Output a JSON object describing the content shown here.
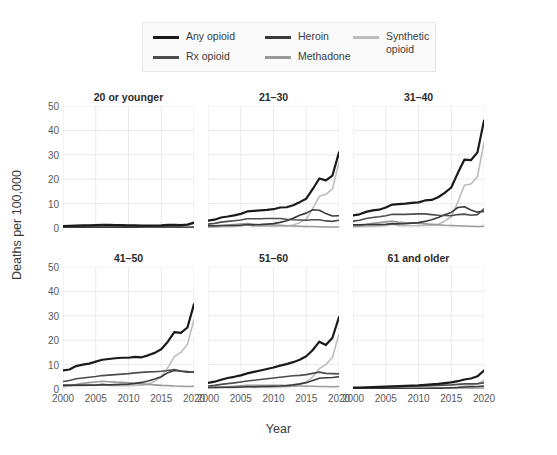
{
  "chart_data": {
    "type": "line",
    "title": "",
    "xlabel": "Year",
    "ylabel": "Deaths per 100,000",
    "xlim": [
      2000,
      2020
    ],
    "ylim": [
      0,
      50
    ],
    "xticks": [
      2000,
      2005,
      2010,
      2015,
      2020
    ],
    "yticks": [
      0,
      10,
      20,
      30,
      40,
      50
    ],
    "grid": true,
    "legend_position": "top-center",
    "facet_layout": [
      2,
      3
    ],
    "legend": [
      {
        "name": "Any opioid",
        "color": "#1a1a1a"
      },
      {
        "name": "Rx opioid",
        "color": "#4d4d4d"
      },
      {
        "name": "Heroin",
        "color": "#3a3a3a"
      },
      {
        "name": "Methadone",
        "color": "#9a9a9a"
      },
      {
        "name": "Synthetic\nopioid",
        "color": "#bdbdbd"
      }
    ],
    "x": [
      2000,
      2001,
      2002,
      2003,
      2004,
      2005,
      2006,
      2007,
      2008,
      2009,
      2010,
      2011,
      2012,
      2013,
      2014,
      2015,
      2016,
      2017,
      2018,
      2019,
      2020
    ],
    "panels": [
      {
        "title": "20 or younger",
        "series": [
          {
            "name": "Any opioid",
            "color": "#1a1a1a",
            "width": 2.2,
            "values": [
              0.8,
              0.9,
              1.0,
              1.1,
              1.1,
              1.2,
              1.3,
              1.3,
              1.2,
              1.2,
              1.1,
              1.1,
              1.0,
              1.0,
              1.0,
              1.1,
              1.3,
              1.3,
              1.2,
              1.4,
              2.2
            ]
          },
          {
            "name": "Rx opioid",
            "color": "#4d4d4d",
            "width": 1.6,
            "values": [
              0.4,
              0.5,
              0.6,
              0.7,
              0.7,
              0.8,
              0.8,
              0.8,
              0.8,
              0.7,
              0.7,
              0.6,
              0.6,
              0.5,
              0.5,
              0.4,
              0.4,
              0.4,
              0.3,
              0.3,
              0.4
            ]
          },
          {
            "name": "Heroin",
            "color": "#3a3a3a",
            "width": 1.6,
            "values": [
              0.2,
              0.2,
              0.2,
              0.2,
              0.2,
              0.3,
              0.3,
              0.3,
              0.3,
              0.3,
              0.3,
              0.3,
              0.4,
              0.5,
              0.5,
              0.5,
              0.5,
              0.4,
              0.3,
              0.2,
              0.2
            ]
          },
          {
            "name": "Methadone",
            "color": "#9a9a9a",
            "width": 1.6,
            "values": [
              0.1,
              0.1,
              0.2,
              0.2,
              0.3,
              0.3,
              0.3,
              0.3,
              0.2,
              0.2,
              0.2,
              0.1,
              0.1,
              0.1,
              0.1,
              0.1,
              0.1,
              0.1,
              0.1,
              0.1,
              0.1
            ]
          },
          {
            "name": "Synthetic opioid",
            "color": "#bdbdbd",
            "width": 1.6,
            "values": [
              0.1,
              0.1,
              0.1,
              0.1,
              0.2,
              0.2,
              0.2,
              0.2,
              0.1,
              0.1,
              0.1,
              0.1,
              0.1,
              0.2,
              0.3,
              0.4,
              0.6,
              0.7,
              0.8,
              1.0,
              1.8
            ]
          }
        ]
      },
      {
        "title": "21–30",
        "series": [
          {
            "name": "Any opioid",
            "color": "#1a1a1a",
            "width": 2.2,
            "values": [
              3.0,
              3.4,
              4.3,
              4.7,
              5.2,
              5.8,
              6.8,
              7.0,
              7.2,
              7.4,
              7.7,
              8.4,
              8.5,
              9.3,
              10.6,
              12.0,
              16.0,
              20.3,
              19.5,
              21.5,
              31.0
            ]
          },
          {
            "name": "Rx opioid",
            "color": "#4d4d4d",
            "width": 1.6,
            "values": [
              1.6,
              1.9,
              2.4,
              2.7,
              3.0,
              3.3,
              3.8,
              3.8,
              3.8,
              3.9,
              3.9,
              3.9,
              3.6,
              3.4,
              3.3,
              3.2,
              3.4,
              3.4,
              2.9,
              2.7,
              3.2
            ]
          },
          {
            "name": "Heroin",
            "color": "#3a3a3a",
            "width": 1.6,
            "values": [
              0.9,
              0.9,
              1.0,
              1.0,
              1.0,
              1.1,
              1.4,
              1.3,
              1.4,
              1.6,
              1.8,
              2.3,
              3.0,
              4.0,
              5.2,
              6.1,
              7.5,
              7.3,
              5.9,
              4.9,
              5.0
            ]
          },
          {
            "name": "Methadone",
            "color": "#9a9a9a",
            "width": 1.6,
            "values": [
              0.4,
              0.6,
              0.9,
              1.2,
              1.4,
              1.6,
              1.8,
              1.5,
              1.4,
              1.3,
              1.2,
              1.1,
              0.9,
              0.8,
              0.7,
              0.6,
              0.6,
              0.5,
              0.4,
              0.4,
              0.4
            ]
          },
          {
            "name": "Synthetic opioid",
            "color": "#bdbdbd",
            "width": 1.6,
            "values": [
              0.3,
              0.3,
              0.4,
              0.5,
              0.6,
              0.8,
              1.2,
              0.7,
              0.7,
              0.7,
              0.7,
              0.8,
              0.8,
              1.2,
              2.2,
              3.6,
              8.0,
              13.0,
              13.8,
              16.0,
              27.0
            ]
          }
        ]
      },
      {
        "title": "31–40",
        "series": [
          {
            "name": "Any opioid",
            "color": "#1a1a1a",
            "width": 2.2,
            "values": [
              5.2,
              5.6,
              6.6,
              7.2,
              7.5,
              8.4,
              9.6,
              9.8,
              10.0,
              10.3,
              10.5,
              11.3,
              11.5,
              12.6,
              14.4,
              16.6,
              22.5,
              28.0,
              27.8,
              31.0,
              44.0
            ]
          },
          {
            "name": "Rx opioid",
            "color": "#4d4d4d",
            "width": 1.6,
            "values": [
              2.8,
              3.2,
              3.9,
              4.3,
              4.6,
              5.0,
              5.6,
              5.6,
              5.6,
              5.7,
              5.8,
              5.8,
              5.5,
              5.2,
              5.1,
              5.0,
              5.5,
              5.7,
              5.2,
              5.5,
              7.8
            ]
          },
          {
            "name": "Heroin",
            "color": "#3a3a3a",
            "width": 1.6,
            "values": [
              1.3,
              1.3,
              1.4,
              1.4,
              1.4,
              1.5,
              1.8,
              1.7,
              1.8,
              2.0,
              2.2,
              2.7,
              3.4,
              4.3,
              5.4,
              6.4,
              8.4,
              8.7,
              7.4,
              6.5,
              6.8
            ]
          },
          {
            "name": "Methadone",
            "color": "#9a9a9a",
            "width": 1.6,
            "values": [
              0.6,
              0.9,
              1.4,
              1.9,
              2.2,
              2.5,
              2.8,
              2.4,
              2.2,
              2.1,
              1.9,
              1.7,
              1.5,
              1.3,
              1.1,
              1.0,
              0.9,
              0.8,
              0.7,
              0.6,
              0.7
            ]
          },
          {
            "name": "Synthetic opioid",
            "color": "#bdbdbd",
            "width": 1.6,
            "values": [
              0.5,
              0.5,
              0.6,
              0.7,
              0.8,
              1.0,
              1.5,
              0.9,
              0.9,
              0.9,
              0.9,
              1.0,
              1.1,
              1.5,
              2.8,
              4.6,
              10.6,
              17.5,
              18.0,
              21.0,
              35.0
            ]
          }
        ]
      },
      {
        "title": "41–50",
        "series": [
          {
            "name": "Any opioid",
            "color": "#1a1a1a",
            "width": 2.2,
            "values": [
              7.6,
              8.0,
              9.4,
              10.0,
              10.4,
              11.2,
              12.0,
              12.3,
              12.6,
              12.8,
              12.8,
              13.2,
              13.0,
              13.8,
              14.8,
              16.3,
              19.4,
              23.3,
              23.0,
              25.2,
              34.8
            ]
          },
          {
            "name": "Rx opioid",
            "color": "#4d4d4d",
            "width": 1.6,
            "values": [
              3.1,
              3.5,
              4.2,
              4.5,
              4.8,
              5.1,
              5.5,
              5.7,
              5.9,
              6.1,
              6.3,
              6.6,
              6.8,
              7.0,
              7.1,
              7.3,
              7.6,
              8.0,
              7.4,
              7.2,
              6.9
            ]
          },
          {
            "name": "Heroin",
            "color": "#3a3a3a",
            "width": 1.6,
            "values": [
              1.6,
              1.6,
              1.6,
              1.6,
              1.6,
              1.6,
              1.8,
              1.7,
              1.8,
              1.9,
              2.0,
              2.3,
              2.7,
              3.3,
              4.1,
              5.0,
              6.7,
              7.6,
              7.3,
              6.9,
              7.0
            ]
          },
          {
            "name": "Methadone",
            "color": "#9a9a9a",
            "width": 1.6,
            "values": [
              0.9,
              1.2,
              1.8,
              2.3,
              2.6,
              2.9,
              3.2,
              3.0,
              2.8,
              2.7,
              2.5,
              2.3,
              2.1,
              1.9,
              1.7,
              1.5,
              1.4,
              1.2,
              1.1,
              1.0,
              1.1
            ]
          },
          {
            "name": "Synthetic opioid",
            "color": "#bdbdbd",
            "width": 1.6,
            "values": [
              1.3,
              1.3,
              1.4,
              1.4,
              1.5,
              1.6,
              2.0,
              1.4,
              1.4,
              1.4,
              1.4,
              1.5,
              1.6,
              2.0,
              3.2,
              5.0,
              8.7,
              13.3,
              15.0,
              18.3,
              28.5
            ]
          }
        ]
      },
      {
        "title": "51–60",
        "series": [
          {
            "name": "Any opioid",
            "color": "#1a1a1a",
            "width": 2.2,
            "values": [
              2.5,
              3.0,
              3.8,
              4.5,
              5.0,
              5.6,
              6.4,
              7.0,
              7.6,
              8.2,
              8.8,
              9.6,
              10.2,
              11.0,
              12.0,
              13.4,
              16.0,
              19.4,
              18.0,
              21.0,
              29.5
            ]
          },
          {
            "name": "Rx opioid",
            "color": "#4d4d4d",
            "width": 1.6,
            "values": [
              1.2,
              1.5,
              1.9,
              2.2,
              2.5,
              2.9,
              3.3,
              3.6,
              3.9,
              4.2,
              4.5,
              4.8,
              5.1,
              5.4,
              5.6,
              5.9,
              6.4,
              6.9,
              6.4,
              6.3,
              6.2
            ]
          },
          {
            "name": "Heroin",
            "color": "#3a3a3a",
            "width": 1.6,
            "values": [
              0.7,
              0.7,
              0.7,
              0.7,
              0.7,
              0.8,
              0.9,
              0.9,
              1.0,
              1.0,
              1.1,
              1.2,
              1.4,
              1.7,
              2.1,
              2.6,
              3.5,
              4.4,
              4.6,
              4.7,
              5.0
            ]
          },
          {
            "name": "Methadone",
            "color": "#9a9a9a",
            "width": 1.6,
            "values": [
              0.4,
              0.5,
              0.7,
              0.9,
              1.1,
              1.3,
              1.5,
              1.5,
              1.5,
              1.5,
              1.5,
              1.5,
              1.4,
              1.3,
              1.2,
              1.1,
              1.1,
              1.0,
              1.0,
              0.9,
              1.0
            ]
          },
          {
            "name": "Synthetic opioid",
            "color": "#bdbdbd",
            "width": 1.6,
            "values": [
              0.4,
              0.4,
              0.5,
              0.5,
              0.6,
              0.7,
              0.9,
              0.6,
              0.7,
              0.7,
              0.7,
              0.8,
              0.9,
              1.1,
              1.8,
              2.8,
              5.0,
              8.4,
              10.0,
              13.0,
              22.5
            ]
          }
        ]
      },
      {
        "title": "61 and older",
        "series": [
          {
            "name": "Any opioid",
            "color": "#1a1a1a",
            "width": 2.2,
            "values": [
              0.6,
              0.6,
              0.7,
              0.8,
              0.9,
              1.0,
              1.1,
              1.2,
              1.3,
              1.4,
              1.5,
              1.7,
              1.9,
              2.1,
              2.4,
              2.7,
              3.2,
              3.9,
              4.3,
              5.2,
              7.6
            ]
          },
          {
            "name": "Rx opioid",
            "color": "#4d4d4d",
            "width": 1.6,
            "values": [
              0.4,
              0.4,
              0.5,
              0.6,
              0.7,
              0.8,
              0.9,
              0.9,
              1.0,
              1.1,
              1.2,
              1.3,
              1.4,
              1.5,
              1.6,
              1.7,
              1.9,
              2.1,
              2.1,
              2.2,
              2.5
            ]
          },
          {
            "name": "Heroin",
            "color": "#3a3a3a",
            "width": 1.6,
            "values": [
              0.1,
              0.1,
              0.1,
              0.1,
              0.1,
              0.1,
              0.2,
              0.2,
              0.2,
              0.2,
              0.2,
              0.2,
              0.3,
              0.3,
              0.4,
              0.5,
              0.6,
              0.8,
              0.9,
              1.0,
              1.2
            ]
          },
          {
            "name": "Methadone",
            "color": "#9a9a9a",
            "width": 1.6,
            "values": [
              0.1,
              0.1,
              0.1,
              0.2,
              0.2,
              0.3,
              0.3,
              0.3,
              0.3,
              0.4,
              0.4,
              0.4,
              0.4,
              0.4,
              0.4,
              0.4,
              0.4,
              0.4,
              0.4,
              0.4,
              0.4
            ]
          },
          {
            "name": "Synthetic opioid",
            "color": "#bdbdbd",
            "width": 1.6,
            "values": [
              0.1,
              0.1,
              0.1,
              0.1,
              0.1,
              0.2,
              0.2,
              0.2,
              0.2,
              0.2,
              0.2,
              0.2,
              0.2,
              0.3,
              0.4,
              0.5,
              0.8,
              1.2,
              1.5,
              2.0,
              3.6
            ]
          }
        ]
      }
    ]
  }
}
